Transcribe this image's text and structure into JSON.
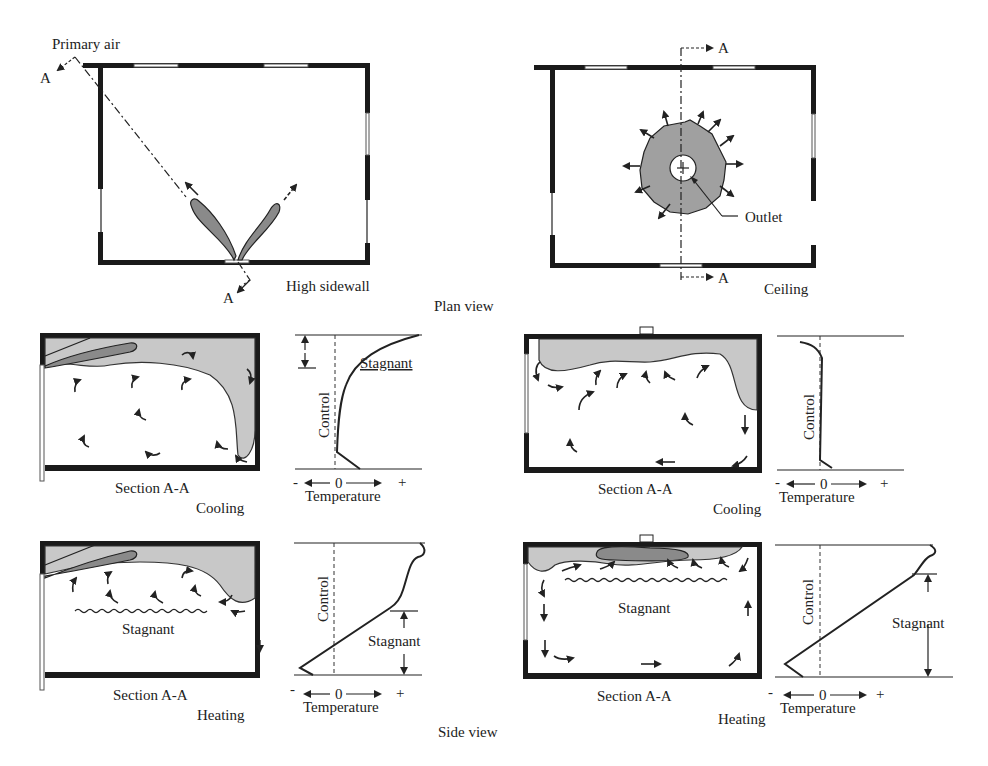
{
  "figure": {
    "plan_view": {
      "caption": "Plan view",
      "left": {
        "label": "High sidewall",
        "primary_air_label": "Primary air",
        "section_marks": [
          "A",
          "A"
        ]
      },
      "right": {
        "label": "Ceiling",
        "outlet_label": "Outlet",
        "section_marks": [
          "A",
          "A"
        ]
      }
    },
    "side_view": {
      "caption": "Side view",
      "panels": [
        {
          "id": "sidewall-cooling",
          "section_label": "Section A-A",
          "mode": "Cooling",
          "graph": {
            "axis_label": "Temperature",
            "axis_minus": "-",
            "axis_zero": "0",
            "axis_plus": "+",
            "control_label": "Control",
            "stagnant_label": "Stagnant"
          }
        },
        {
          "id": "ceiling-cooling",
          "section_label": "Section A-A",
          "mode": "Cooling",
          "graph": {
            "axis_label": "Temperature",
            "axis_minus": "-",
            "axis_zero": "0",
            "axis_plus": "+",
            "control_label": "Control"
          }
        },
        {
          "id": "sidewall-heating",
          "section_label": "Section A-A",
          "mode": "Heating",
          "room_stagnant_label": "Stagnant",
          "graph": {
            "axis_label": "Temperature",
            "axis_minus": "-",
            "axis_zero": "0",
            "axis_plus": "+",
            "control_label": "Control",
            "stagnant_label": "Stagnant"
          }
        },
        {
          "id": "ceiling-heating",
          "section_label": "Section A-A",
          "mode": "Heating",
          "room_stagnant_label": "Stagnant",
          "graph": {
            "axis_label": "Temperature",
            "axis_minus": "-",
            "axis_zero": "0",
            "axis_plus": "+",
            "control_label": "Control",
            "stagnant_label": "Stagnant"
          }
        }
      ]
    },
    "colors": {
      "wall": "#1a1a1a",
      "primary_air_dark": "#8a8a8a",
      "mixed_air_light": "#c8c8c8"
    }
  }
}
